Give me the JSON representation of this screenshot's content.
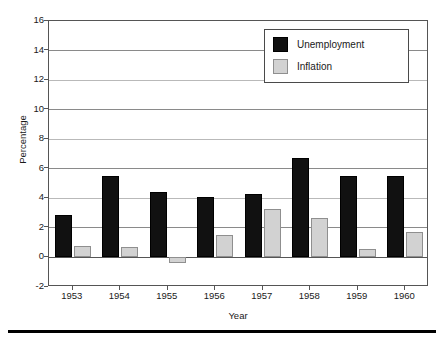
{
  "chart_data": {
    "type": "bar",
    "title": "",
    "xlabel": "Year",
    "ylabel": "Percentage",
    "categories": [
      "1953",
      "1954",
      "1955",
      "1956",
      "1957",
      "1958",
      "1959",
      "1960"
    ],
    "series": [
      {
        "name": "Unemployment",
        "color": "#111111",
        "values": [
          2.9,
          5.5,
          4.4,
          4.1,
          4.3,
          6.7,
          5.5,
          5.5
        ]
      },
      {
        "name": "Inflation",
        "color": "#d2d2d2",
        "values": [
          0.8,
          0.7,
          -0.4,
          1.5,
          3.3,
          2.7,
          0.6,
          1.7
        ]
      }
    ],
    "ylim": [
      -2,
      16
    ],
    "yticks": [
      -2,
      0,
      2,
      4,
      6,
      8,
      10,
      12,
      14,
      16
    ],
    "ytick_labels": [
      "-2",
      "0",
      "2",
      "4",
      "6",
      "8",
      "10",
      "12",
      "14",
      "16"
    ],
    "grid": true,
    "grid_axis": "y",
    "legend_position": "top-right",
    "legend_entries": [
      "Unemployment",
      "Inflation"
    ]
  }
}
